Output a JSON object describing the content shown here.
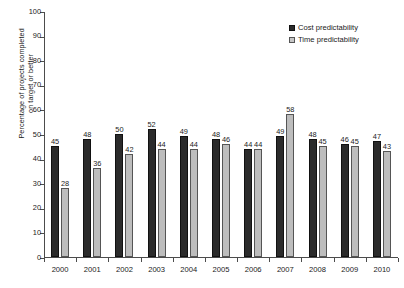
{
  "chart_data": {
    "type": "bar",
    "title": "",
    "xlabel": "",
    "ylabel": "Percentage of projects completed\non target or better",
    "ylim": [
      0,
      100
    ],
    "ytick_step": 10,
    "yticks": [
      0,
      10,
      20,
      30,
      40,
      50,
      60,
      70,
      80,
      90,
      100
    ],
    "grid": false,
    "legend_position": "top-right",
    "categories": [
      "2000",
      "2001",
      "2002",
      "2003",
      "2004",
      "2005",
      "2006",
      "2007",
      "2008",
      "2009",
      "2010"
    ],
    "series": [
      {
        "name": "Cost predictability",
        "color": "#2b2b2b",
        "values": [
          45,
          48,
          50,
          52,
          49,
          48,
          44,
          49,
          48,
          46,
          47
        ]
      },
      {
        "name": "Time predictability",
        "color": "#bdbdbd",
        "values": [
          28,
          36,
          42,
          44,
          44,
          46,
          44,
          58,
          45,
          45,
          43
        ]
      }
    ]
  },
  "legend": {
    "items": [
      {
        "label": "Cost predictability",
        "swatch": "cost"
      },
      {
        "label": "Time predictability",
        "swatch": "time"
      }
    ]
  }
}
